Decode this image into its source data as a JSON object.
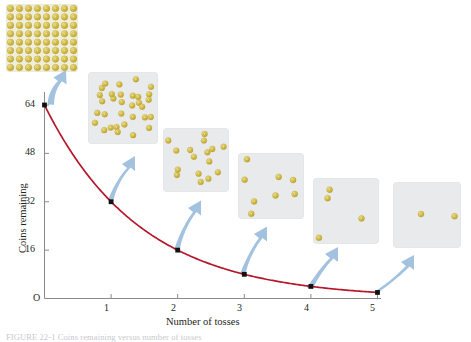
{
  "figure": {
    "caption": "FIGURE 22-1  Coins remaining versus number of tosses"
  },
  "chart_data": {
    "type": "line",
    "title": "",
    "xlabel": "Number of tosses",
    "ylabel": "Coins remaining",
    "x": [
      0,
      1,
      2,
      3,
      4,
      5
    ],
    "values": [
      64,
      32,
      16,
      8,
      4,
      2
    ],
    "x_ticks": [
      "1",
      "2",
      "3",
      "4",
      "5"
    ],
    "y_ticks": [
      "64",
      "48",
      "32",
      "16"
    ],
    "origin_label": "O",
    "xlim": [
      0,
      5.1
    ],
    "ylim": [
      0,
      70
    ],
    "grid": false,
    "legend": null,
    "curve_color": "#b5182b",
    "point_color": "#111111",
    "arrow_color": "#9dbfdd",
    "series": [
      {
        "name": "Coins remaining",
        "values": [
          64,
          32,
          16,
          8,
          4,
          2
        ]
      }
    ]
  },
  "panels": [
    {
      "name": "panel-toss-0",
      "coins": 64,
      "layout": "grid",
      "note": "64 coins in dense grid"
    },
    {
      "name": "panel-toss-1",
      "coins": 32,
      "layout": "scatter",
      "note": "32 coins scattered"
    },
    {
      "name": "panel-toss-2",
      "coins": 16,
      "layout": "scatter",
      "note": "16 coins scattered"
    },
    {
      "name": "panel-toss-3",
      "coins": 8,
      "layout": "scatter",
      "note": "8 coins scattered"
    },
    {
      "name": "panel-toss-4",
      "coins": 4,
      "layout": "scatter",
      "note": "4 coins scattered"
    },
    {
      "name": "panel-toss-5",
      "coins": 2,
      "layout": "scatter",
      "note": "2 coins scattered"
    }
  ]
}
